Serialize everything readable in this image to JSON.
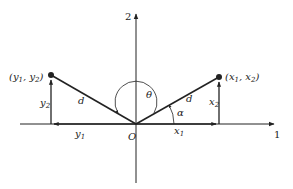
{
  "diagram": {
    "axes": {
      "horizontal_label": "1",
      "vertical_label": "2",
      "origin_label": "O"
    },
    "points": [
      {
        "name": "left-point",
        "label": "(y",
        "sub1": "1",
        "mid": ", y",
        "sub2": "2",
        "end": ")"
      },
      {
        "name": "right-point",
        "label": "(x",
        "sub1": "1",
        "mid": ", x",
        "sub2": "2",
        "end": ")"
      }
    ],
    "labels": {
      "left_distance": "d",
      "right_distance": "d",
      "theta": "θ",
      "alpha": "α",
      "y1": "y",
      "y1_sub": "1",
      "y2": "y",
      "y2_sub": "2",
      "x1": "x",
      "x1_sub": "1",
      "x2": "x",
      "x2_sub": "2"
    },
    "colors": {
      "line": "#222222",
      "background": "#ffffff"
    }
  }
}
